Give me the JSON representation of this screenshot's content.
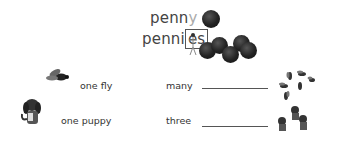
{
  "header": {
    "singular": {
      "stem": "penn",
      "ending": "y"
    },
    "plural": {
      "stem": "penni",
      "ending": "es"
    }
  },
  "rows": [
    {
      "singular": "one fly",
      "plural_prefix": "many",
      "picture": "fly",
      "plural_picture": "flies"
    },
    {
      "singular": "one puppy",
      "plural_prefix": "three",
      "picture": "puppy",
      "plural_picture": "puppies"
    }
  ],
  "colors": {
    "faded_letter": "#aaaaaa",
    "ink": "#333333"
  }
}
